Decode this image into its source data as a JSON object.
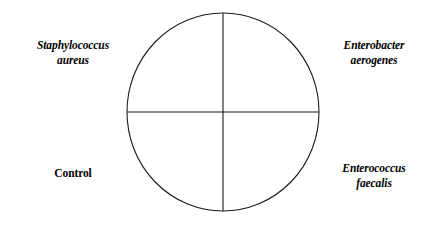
{
  "figure": {
    "type": "agar-plate-quadrant-diagram",
    "background_color": "#ffffff",
    "line_color": "#1a1a1a",
    "line_width": 1,
    "circle": {
      "center_x": 223,
      "center_y": 112,
      "radius_x": 96,
      "radius_y": 99
    },
    "dividers": {
      "vertical": {
        "x": 223,
        "y1": 13,
        "y2": 211
      },
      "horizontal": {
        "y": 112,
        "x1": 127,
        "x2": 319
      }
    }
  },
  "labels": {
    "top_left": {
      "name": "staphylococcus-aureus",
      "style": "bold-italic",
      "line1": "Staphylococcus",
      "line2": "aureus"
    },
    "top_right": {
      "name": "enterobacter-aerogenes",
      "style": "bold-italic",
      "line1": "Enterobacter",
      "line2": "aerogenes"
    },
    "bottom_left": {
      "name": "control",
      "style": "bold-upright",
      "line1": "Control",
      "line2": ""
    },
    "bottom_right": {
      "name": "enterococcus-faecalis",
      "style": "bold-italic",
      "line1": "Enterococcus",
      "line2": "faecalis"
    }
  }
}
